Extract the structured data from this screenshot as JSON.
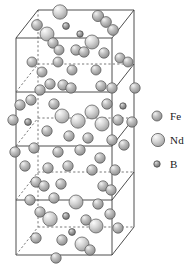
{
  "figure": {
    "name": "nd2fe14b-unit-cell",
    "background": "#ffffff",
    "width": 186,
    "height": 276
  },
  "legend": {
    "name": "atom-species-legend",
    "items": [
      {
        "symbol": "Fe",
        "label": "Fe",
        "radius": 5.0,
        "color": "#9a9a9a",
        "icon": "sphere-icon"
      },
      {
        "symbol": "Nd",
        "label": "Nd",
        "radius": 6.6,
        "color": "#b5b5b5",
        "icon": "sphere-icon"
      },
      {
        "symbol": "B",
        "label": "B",
        "radius": 3.2,
        "color": "#7d7d7d",
        "icon": "sphere-icon"
      }
    ]
  },
  "cell": {
    "name": "unit-cell-box",
    "line_color": "#3a3a3a",
    "dashed_color": "#6a6a6a",
    "stroke_width": 0.9,
    "front_bottom_left": [
      16,
      255
    ],
    "front_bottom_right": [
      112,
      255
    ],
    "front_top_left": [
      16,
      38
    ],
    "front_top_right": [
      112,
      38
    ],
    "depth_dx": 22,
    "depth_dy": -28,
    "layer_y": [
      38,
      92,
      146,
      200,
      255
    ]
  },
  "atoms": {
    "name": "atom-sphere-set",
    "count": 68,
    "species_colors": {
      "Fe": "#9a9a9a",
      "Nd": "#b5b5b5",
      "B": "#7d7d7d"
    },
    "list": [
      {
        "s": "Nd",
        "x": 60,
        "y": 12,
        "r": 7.2
      },
      {
        "s": "B",
        "x": 66,
        "y": 26,
        "r": 3.4
      },
      {
        "s": "Fe",
        "x": 98,
        "y": 16,
        "r": 5.6
      },
      {
        "s": "Fe",
        "x": 106,
        "y": 22,
        "r": 5.4
      },
      {
        "s": "B",
        "x": 80,
        "y": 34,
        "r": 3.2
      },
      {
        "s": "Fe",
        "x": 37,
        "y": 25,
        "r": 5.4
      },
      {
        "s": "Nd",
        "x": 47,
        "y": 34,
        "r": 7.0
      },
      {
        "s": "Fe",
        "x": 113,
        "y": 30,
        "r": 5.4
      },
      {
        "s": "Fe",
        "x": 53,
        "y": 43,
        "r": 5.2
      },
      {
        "s": "Nd",
        "x": 92,
        "y": 42,
        "r": 7.0
      },
      {
        "s": "Fe",
        "x": 76,
        "y": 50,
        "r": 5.2
      },
      {
        "s": "Fe",
        "x": 84,
        "y": 52,
        "r": 5.2
      },
      {
        "s": "Fe",
        "x": 59,
        "y": 50,
        "r": 5.0
      },
      {
        "s": "Fe",
        "x": 104,
        "y": 53,
        "r": 5.2
      },
      {
        "s": "Fe",
        "x": 32,
        "y": 62,
        "r": 5.0
      },
      {
        "s": "Fe",
        "x": 58,
        "y": 62,
        "r": 5.0
      },
      {
        "s": "Fe",
        "x": 120,
        "y": 58,
        "r": 5.0
      },
      {
        "s": "Fe",
        "x": 128,
        "y": 62,
        "r": 5.0
      },
      {
        "s": "Fe",
        "x": 42,
        "y": 72,
        "r": 5.0
      },
      {
        "s": "Fe",
        "x": 72,
        "y": 70,
        "r": 5.0
      },
      {
        "s": "Fe",
        "x": 96,
        "y": 70,
        "r": 5.0
      },
      {
        "s": "Fe",
        "x": 50,
        "y": 84,
        "r": 5.2
      },
      {
        "s": "Fe",
        "x": 40,
        "y": 90,
        "r": 5.2
      },
      {
        "s": "Fe",
        "x": 63,
        "y": 85,
        "r": 5.2
      },
      {
        "s": "Fe",
        "x": 71,
        "y": 88,
        "r": 5.2
      },
      {
        "s": "Fe",
        "x": 101,
        "y": 86,
        "r": 5.2
      },
      {
        "s": "Fe",
        "x": 112,
        "y": 88,
        "r": 5.2
      },
      {
        "s": "Fe",
        "x": 135,
        "y": 88,
        "r": 5.2
      },
      {
        "s": "Fe",
        "x": 20,
        "y": 105,
        "r": 5.2
      },
      {
        "s": "Fe",
        "x": 31,
        "y": 100,
        "r": 5.2
      },
      {
        "s": "Fe",
        "x": 54,
        "y": 104,
        "r": 5.2
      },
      {
        "s": "Nd",
        "x": 62,
        "y": 116,
        "r": 7.0
      },
      {
        "s": "Nd",
        "x": 92,
        "y": 112,
        "r": 7.0
      },
      {
        "s": "Fe",
        "x": 107,
        "y": 104,
        "r": 5.2
      },
      {
        "s": "B",
        "x": 123,
        "y": 106,
        "r": 3.2
      },
      {
        "s": "Fe",
        "x": 13,
        "y": 120,
        "r": 5.2
      },
      {
        "s": "B",
        "x": 28,
        "y": 122,
        "r": 3.4
      },
      {
        "s": "Nd",
        "x": 78,
        "y": 121,
        "r": 7.2
      },
      {
        "s": "Nd",
        "x": 102,
        "y": 124,
        "r": 7.0
      },
      {
        "s": "Fe",
        "x": 118,
        "y": 120,
        "r": 5.2
      },
      {
        "s": "Fe",
        "x": 132,
        "y": 122,
        "r": 5.2
      },
      {
        "s": "Fe",
        "x": 47,
        "y": 131,
        "r": 5.2
      },
      {
        "s": "Fe",
        "x": 69,
        "y": 136,
        "r": 5.2
      },
      {
        "s": "Fe",
        "x": 88,
        "y": 138,
        "r": 5.2
      },
      {
        "s": "Fe",
        "x": 112,
        "y": 140,
        "r": 5.2
      },
      {
        "s": "Fe",
        "x": 124,
        "y": 145,
        "r": 5.2
      },
      {
        "s": "Fe",
        "x": 15,
        "y": 152,
        "r": 5.2
      },
      {
        "s": "Fe",
        "x": 34,
        "y": 148,
        "r": 5.2
      },
      {
        "s": "Fe",
        "x": 58,
        "y": 152,
        "r": 5.2
      },
      {
        "s": "Fe",
        "x": 80,
        "y": 150,
        "r": 5.2
      },
      {
        "s": "Fe",
        "x": 100,
        "y": 158,
        "r": 5.2
      },
      {
        "s": "Fe",
        "x": 25,
        "y": 166,
        "r": 5.2
      },
      {
        "s": "Fe",
        "x": 48,
        "y": 168,
        "r": 5.2
      },
      {
        "s": "Fe",
        "x": 68,
        "y": 166,
        "r": 5.2
      },
      {
        "s": "Fe",
        "x": 92,
        "y": 170,
        "r": 5.2
      },
      {
        "s": "Fe",
        "x": 115,
        "y": 170,
        "r": 5.2
      },
      {
        "s": "Fe",
        "x": 36,
        "y": 182,
        "r": 5.2
      },
      {
        "s": "Fe",
        "x": 44,
        "y": 186,
        "r": 5.2
      },
      {
        "s": "Fe",
        "x": 61,
        "y": 184,
        "r": 5.2
      },
      {
        "s": "Fe",
        "x": 103,
        "y": 186,
        "r": 5.2
      },
      {
        "s": "Fe",
        "x": 111,
        "y": 190,
        "r": 5.2
      },
      {
        "s": "Fe",
        "x": 30,
        "y": 200,
        "r": 5.2
      },
      {
        "s": "Fe",
        "x": 54,
        "y": 198,
        "r": 5.2
      },
      {
        "s": "Nd",
        "x": 76,
        "y": 202,
        "r": 7.0
      },
      {
        "s": "Fe",
        "x": 98,
        "y": 204,
        "r": 5.2
      },
      {
        "s": "B",
        "x": 66,
        "y": 216,
        "r": 3.4
      },
      {
        "s": "Nd",
        "x": 50,
        "y": 219,
        "r": 7.2
      },
      {
        "s": "Fe",
        "x": 40,
        "y": 212,
        "r": 5.2
      },
      {
        "s": "Fe",
        "x": 86,
        "y": 220,
        "r": 5.2
      },
      {
        "s": "Nd",
        "x": 96,
        "y": 226,
        "r": 7.0
      },
      {
        "s": "Fe",
        "x": 110,
        "y": 214,
        "r": 5.2
      },
      {
        "s": "Fe",
        "x": 118,
        "y": 228,
        "r": 5.2
      },
      {
        "s": "Fe",
        "x": 36,
        "y": 238,
        "r": 5.2
      },
      {
        "s": "Fe",
        "x": 62,
        "y": 240,
        "r": 5.2
      },
      {
        "s": "Nd",
        "x": 82,
        "y": 244,
        "r": 7.0
      },
      {
        "s": "Fe",
        "x": 90,
        "y": 250,
        "r": 5.2
      },
      {
        "s": "Fe",
        "x": 56,
        "y": 258,
        "r": 5.2
      },
      {
        "s": "B",
        "x": 72,
        "y": 232,
        "r": 3.4
      }
    ]
  }
}
